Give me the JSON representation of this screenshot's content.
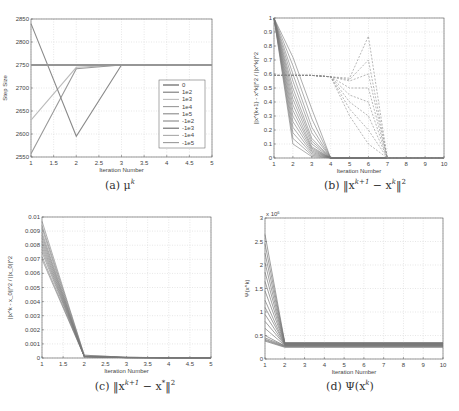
{
  "chart_data": [
    {
      "id": "a",
      "type": "line",
      "caption": "(a) μ^k",
      "caption_text": "(a) μ",
      "caption_sup": "k",
      "title": "",
      "xlabel": "Iteration Number",
      "ylabel": "Step Size",
      "xlim": [
        1,
        5
      ],
      "ylim": [
        2550,
        2850
      ],
      "xticks": [
        "1",
        "1.5",
        "2",
        "2.5",
        "3",
        "3.5",
        "4",
        "4.5",
        "5"
      ],
      "yticks": [
        "2550",
        "2600",
        "2650",
        "2700",
        "2750",
        "2800",
        "2850"
      ],
      "grid": true,
      "legend_position": "right-center",
      "legend": [
        "0",
        "1e2",
        "1e3",
        "1e4",
        "1e5",
        "-1e2",
        "-1e3",
        "-1e4",
        "-1e5"
      ],
      "x": [
        1,
        2,
        3,
        4,
        5
      ],
      "series": [
        {
          "name": "0",
          "values": [
            2750,
            2750,
            2750,
            2750,
            2750
          ],
          "color": "#555555"
        },
        {
          "name": "1e2",
          "values": [
            2750,
            2750,
            2750,
            2750,
            2750
          ],
          "color": "#777777"
        },
        {
          "name": "1e3",
          "values": [
            2630,
            2745,
            2750,
            2750,
            2750
          ],
          "color": "#bbbbbb"
        },
        {
          "name": "1e4",
          "values": [
            2557,
            2742,
            2750,
            2750,
            2750
          ],
          "color": "#999999"
        },
        {
          "name": "1e5",
          "values": [
            2840,
            2595,
            2750,
            2750,
            2750
          ],
          "color": "#8a8a8a"
        },
        {
          "name": "-1e2",
          "values": [
            2750,
            2750,
            2750,
            2750,
            2750
          ],
          "color": "#888888"
        },
        {
          "name": "-1e3",
          "values": [
            2750,
            2750,
            2750,
            2750,
            2750
          ],
          "color": "#666666"
        },
        {
          "name": "-1e4",
          "values": [
            2750,
            2750,
            2750,
            2750,
            2750
          ],
          "color": "#aaaaaa"
        },
        {
          "name": "-1e5",
          "values": [
            2750,
            2750,
            2750,
            2750,
            2750
          ],
          "color": "#9a9a9a"
        }
      ]
    },
    {
      "id": "b",
      "type": "line",
      "caption": "(b) ||x^{k+1} - x^k||^2",
      "caption_prefix": "(b) ‖x",
      "caption_sup1": "k+1",
      "caption_mid": " − x",
      "caption_sup2": "k",
      "caption_suffix": "‖",
      "caption_sup3": "2",
      "title": "",
      "xlabel": "Iteration Number",
      "ylabel": "||x^{k+1} - x^k||^2 / ||x^k||^2",
      "xlim": [
        1,
        10
      ],
      "ylim": [
        0,
        1
      ],
      "xticks": [
        "1",
        "2",
        "3",
        "4",
        "5",
        "6",
        "7",
        "8",
        "9",
        "10"
      ],
      "yticks": [
        "0",
        "0.1",
        "0.2",
        "0.3",
        "0.4",
        "0.5",
        "0.6",
        "0.7",
        "0.8",
        "0.9",
        "1"
      ],
      "grid": true,
      "x": [
        1,
        2,
        3,
        4,
        5,
        6,
        7,
        8,
        9,
        10
      ],
      "series_solid_description": "approx. 30 solid curves starting at 1.0 and decaying to ~0 by iteration 4",
      "series_solid": [
        [
          1,
          0.1,
          0.01,
          0,
          0,
          0,
          0,
          0,
          0,
          0
        ],
        [
          1,
          0.14,
          0.02,
          0,
          0,
          0,
          0,
          0,
          0,
          0
        ],
        [
          1,
          0.18,
          0.03,
          0,
          0,
          0,
          0,
          0,
          0,
          0
        ],
        [
          1,
          0.22,
          0.04,
          0,
          0,
          0,
          0,
          0,
          0,
          0
        ],
        [
          1,
          0.26,
          0.05,
          0,
          0,
          0,
          0,
          0,
          0,
          0
        ],
        [
          1,
          0.3,
          0.06,
          0,
          0,
          0,
          0,
          0,
          0,
          0
        ],
        [
          1,
          0.34,
          0.07,
          0,
          0,
          0,
          0,
          0,
          0,
          0
        ],
        [
          1,
          0.38,
          0.08,
          0,
          0,
          0,
          0,
          0,
          0,
          0
        ],
        [
          1,
          0.42,
          0.1,
          0,
          0,
          0,
          0,
          0,
          0,
          0
        ],
        [
          1,
          0.46,
          0.12,
          0,
          0,
          0,
          0,
          0,
          0,
          0
        ],
        [
          1,
          0.5,
          0.14,
          0,
          0,
          0,
          0,
          0,
          0,
          0
        ],
        [
          1,
          0.55,
          0.18,
          0,
          0,
          0,
          0,
          0,
          0,
          0
        ],
        [
          1,
          0.6,
          0.22,
          0,
          0,
          0,
          0,
          0,
          0,
          0
        ],
        [
          1,
          0.66,
          0.28,
          0,
          0,
          0,
          0,
          0,
          0,
          0
        ],
        [
          1,
          0.72,
          0.35,
          0,
          0,
          0,
          0,
          0,
          0,
          0
        ]
      ],
      "series_dashed_description": "dashed curves at ~0.59 from iteration 1 to 5, rising to 0.6–0.87 at iteration 6, dropping to 0 at 7",
      "series_dashed": [
        [
          0.59,
          0.59,
          0.59,
          0.58,
          0.57,
          0.87,
          0,
          0,
          0,
          0
        ],
        [
          0.59,
          0.59,
          0.59,
          0.58,
          0.56,
          0.7,
          0,
          0,
          0,
          0
        ],
        [
          0.59,
          0.59,
          0.59,
          0.58,
          0.55,
          0.6,
          0,
          0,
          0,
          0
        ],
        [
          0.59,
          0.59,
          0.59,
          0.58,
          0.5,
          0.5,
          0,
          0,
          0,
          0
        ],
        [
          0.59,
          0.59,
          0.59,
          0.58,
          0.45,
          0.4,
          0,
          0,
          0,
          0
        ],
        [
          0.59,
          0.59,
          0.59,
          0.58,
          0.4,
          0.3,
          0,
          0,
          0,
          0
        ],
        [
          0.59,
          0.59,
          0.59,
          0.58,
          0.35,
          0.2,
          0,
          0,
          0,
          0
        ],
        [
          0.59,
          0.59,
          0.59,
          0.58,
          0.3,
          0.1,
          0,
          0,
          0,
          0
        ]
      ]
    },
    {
      "id": "c",
      "type": "line",
      "caption": "(c) ||x^{k+1} - x*||^2",
      "caption_prefix": "(c) ‖x",
      "caption_sup1": "k+1",
      "caption_mid": " − x",
      "caption_sup2": "*",
      "caption_suffix": "‖",
      "caption_sup3": "2",
      "title": "",
      "xlabel": "Iteration Number",
      "ylabel": "||x^k - x_0||^2 / ||x_0||^2",
      "xlim": [
        1,
        5
      ],
      "ylim": [
        0,
        0.01
      ],
      "xticks": [
        "1",
        "1.5",
        "2",
        "2.5",
        "3",
        "3.5",
        "4",
        "4.5",
        "5"
      ],
      "yticks": [
        "0",
        "0.001",
        "0.002",
        "0.003",
        "0.004",
        "0.005",
        "0.006",
        "0.007",
        "0.008",
        "0.009",
        "0.01"
      ],
      "grid": true,
      "x": [
        1,
        2,
        3,
        4,
        5
      ],
      "series": [
        [
          0.0097,
          0.0002,
          5e-05,
          2e-05,
          1e-05
        ],
        [
          0.0094,
          0.0002,
          5e-05,
          2e-05,
          1e-05
        ],
        [
          0.0092,
          0.0001,
          4e-05,
          2e-05,
          1e-05
        ],
        [
          0.0089,
          0.0001,
          4e-05,
          2e-05,
          1e-05
        ],
        [
          0.0087,
          0.0001,
          4e-05,
          2e-05,
          1e-05
        ],
        [
          0.0085,
          0.0001,
          3e-05,
          1e-05,
          1e-05
        ],
        [
          0.0083,
          0.0001,
          3e-05,
          1e-05,
          1e-05
        ],
        [
          0.0081,
          0.0001,
          3e-05,
          1e-05,
          1e-05
        ],
        [
          0.0079,
          0.0001,
          3e-05,
          1e-05,
          1e-05
        ],
        [
          0.0077,
          0.0001,
          3e-05,
          1e-05,
          1e-05
        ],
        [
          0.0075,
          0.0001,
          2e-05,
          1e-05,
          1e-05
        ],
        [
          0.0072,
          0.0001,
          2e-05,
          1e-05,
          1e-05
        ],
        [
          0.007,
          0.0001,
          2e-05,
          1e-05,
          1e-05
        ]
      ]
    },
    {
      "id": "d",
      "type": "line",
      "caption": "(d) Ψ(x^k)",
      "caption_prefix": "(d) Ψ(x",
      "caption_sup1": "k",
      "caption_suffix": ")",
      "title": "",
      "xlabel": "Iteration Number",
      "ylabel": "Ψ(x^k)",
      "y_multiplier": "x 10^6",
      "y_multiplier_base": "x 10",
      "y_multiplier_exp": "6",
      "xlim": [
        1,
        10
      ],
      "ylim": [
        0,
        3
      ],
      "xticks": [
        "1",
        "2",
        "3",
        "4",
        "5",
        "6",
        "7",
        "8",
        "9",
        "10"
      ],
      "yticks": [
        "0",
        "0.5",
        "1",
        "1.5",
        "2",
        "2.5",
        "3"
      ],
      "grid": true,
      "x": [
        1,
        2,
        3,
        4,
        5,
        6,
        7,
        8,
        9,
        10
      ],
      "series": [
        [
          2.65,
          0.35,
          0.35,
          0.35,
          0.35,
          0.35,
          0.35,
          0.35,
          0.35,
          0.35
        ],
        [
          2.45,
          0.34,
          0.34,
          0.34,
          0.34,
          0.34,
          0.34,
          0.34,
          0.34,
          0.34
        ],
        [
          2.25,
          0.34,
          0.34,
          0.34,
          0.34,
          0.34,
          0.34,
          0.34,
          0.34,
          0.34
        ],
        [
          2.05,
          0.33,
          0.33,
          0.33,
          0.33,
          0.33,
          0.33,
          0.33,
          0.33,
          0.33
        ],
        [
          1.85,
          0.33,
          0.33,
          0.33,
          0.33,
          0.33,
          0.33,
          0.33,
          0.33,
          0.33
        ],
        [
          1.65,
          0.32,
          0.32,
          0.32,
          0.32,
          0.32,
          0.32,
          0.32,
          0.32,
          0.32
        ],
        [
          1.45,
          0.32,
          0.32,
          0.32,
          0.32,
          0.32,
          0.32,
          0.32,
          0.32,
          0.32
        ],
        [
          1.25,
          0.31,
          0.31,
          0.31,
          0.31,
          0.31,
          0.31,
          0.31,
          0.31,
          0.31
        ],
        [
          1.1,
          0.31,
          0.31,
          0.31,
          0.31,
          0.31,
          0.31,
          0.31,
          0.31,
          0.31
        ],
        [
          0.95,
          0.3,
          0.3,
          0.3,
          0.3,
          0.3,
          0.3,
          0.3,
          0.3,
          0.3
        ],
        [
          0.8,
          0.3,
          0.3,
          0.3,
          0.3,
          0.3,
          0.3,
          0.3,
          0.3,
          0.3
        ],
        [
          0.65,
          0.29,
          0.29,
          0.29,
          0.29,
          0.29,
          0.29,
          0.29,
          0.29,
          0.29
        ],
        [
          0.5,
          0.28,
          0.28,
          0.28,
          0.28,
          0.28,
          0.28,
          0.28,
          0.28,
          0.28
        ],
        [
          0.45,
          0.28,
          0.28,
          0.28,
          0.28,
          0.28,
          0.28,
          0.28,
          0.28,
          0.28
        ],
        [
          0.42,
          0.27,
          0.27,
          0.27,
          0.27,
          0.27,
          0.27,
          0.27,
          0.27,
          0.27
        ],
        [
          0.4,
          0.26,
          0.26,
          0.26,
          0.26,
          0.26,
          0.26,
          0.26,
          0.26,
          0.26
        ],
        [
          0.38,
          0.25,
          0.25,
          0.25,
          0.25,
          0.25,
          0.25,
          0.25,
          0.25,
          0.25
        ]
      ]
    }
  ],
  "layout": {
    "frames": {
      "a": {
        "x0": 31,
        "y0": 19,
        "x1": 212,
        "y1": 157
      },
      "b": {
        "x0": 274,
        "y0": 18,
        "x1": 444,
        "y1": 158
      },
      "c": {
        "x0": 42,
        "y0": 217,
        "x1": 211,
        "y1": 358
      },
      "d": {
        "x0": 265,
        "y0": 218,
        "x1": 443,
        "y1": 359
      }
    }
  }
}
